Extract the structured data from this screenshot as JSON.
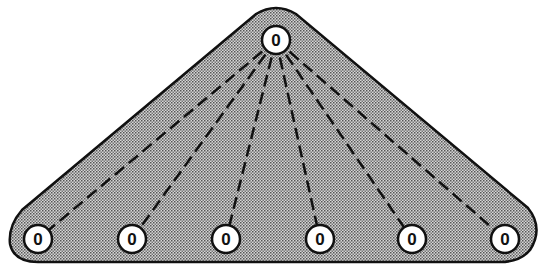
{
  "diagram": {
    "type": "star-broadcast",
    "root": {
      "label": "0",
      "x": 276,
      "y": 40
    },
    "leaves": [
      {
        "label": "0",
        "x": 38,
        "y": 239
      },
      {
        "label": "0",
        "x": 132,
        "y": 239
      },
      {
        "label": "0",
        "x": 226,
        "y": 239
      },
      {
        "label": "0",
        "x": 320,
        "y": 239
      },
      {
        "label": "0",
        "x": 412,
        "y": 239
      },
      {
        "label": "0",
        "x": 505,
        "y": 239
      }
    ],
    "edge_style": "dashed",
    "colors": {
      "fill": "#bdbdbd",
      "stroke": "#111111",
      "node_fill": "#ffffff"
    }
  }
}
